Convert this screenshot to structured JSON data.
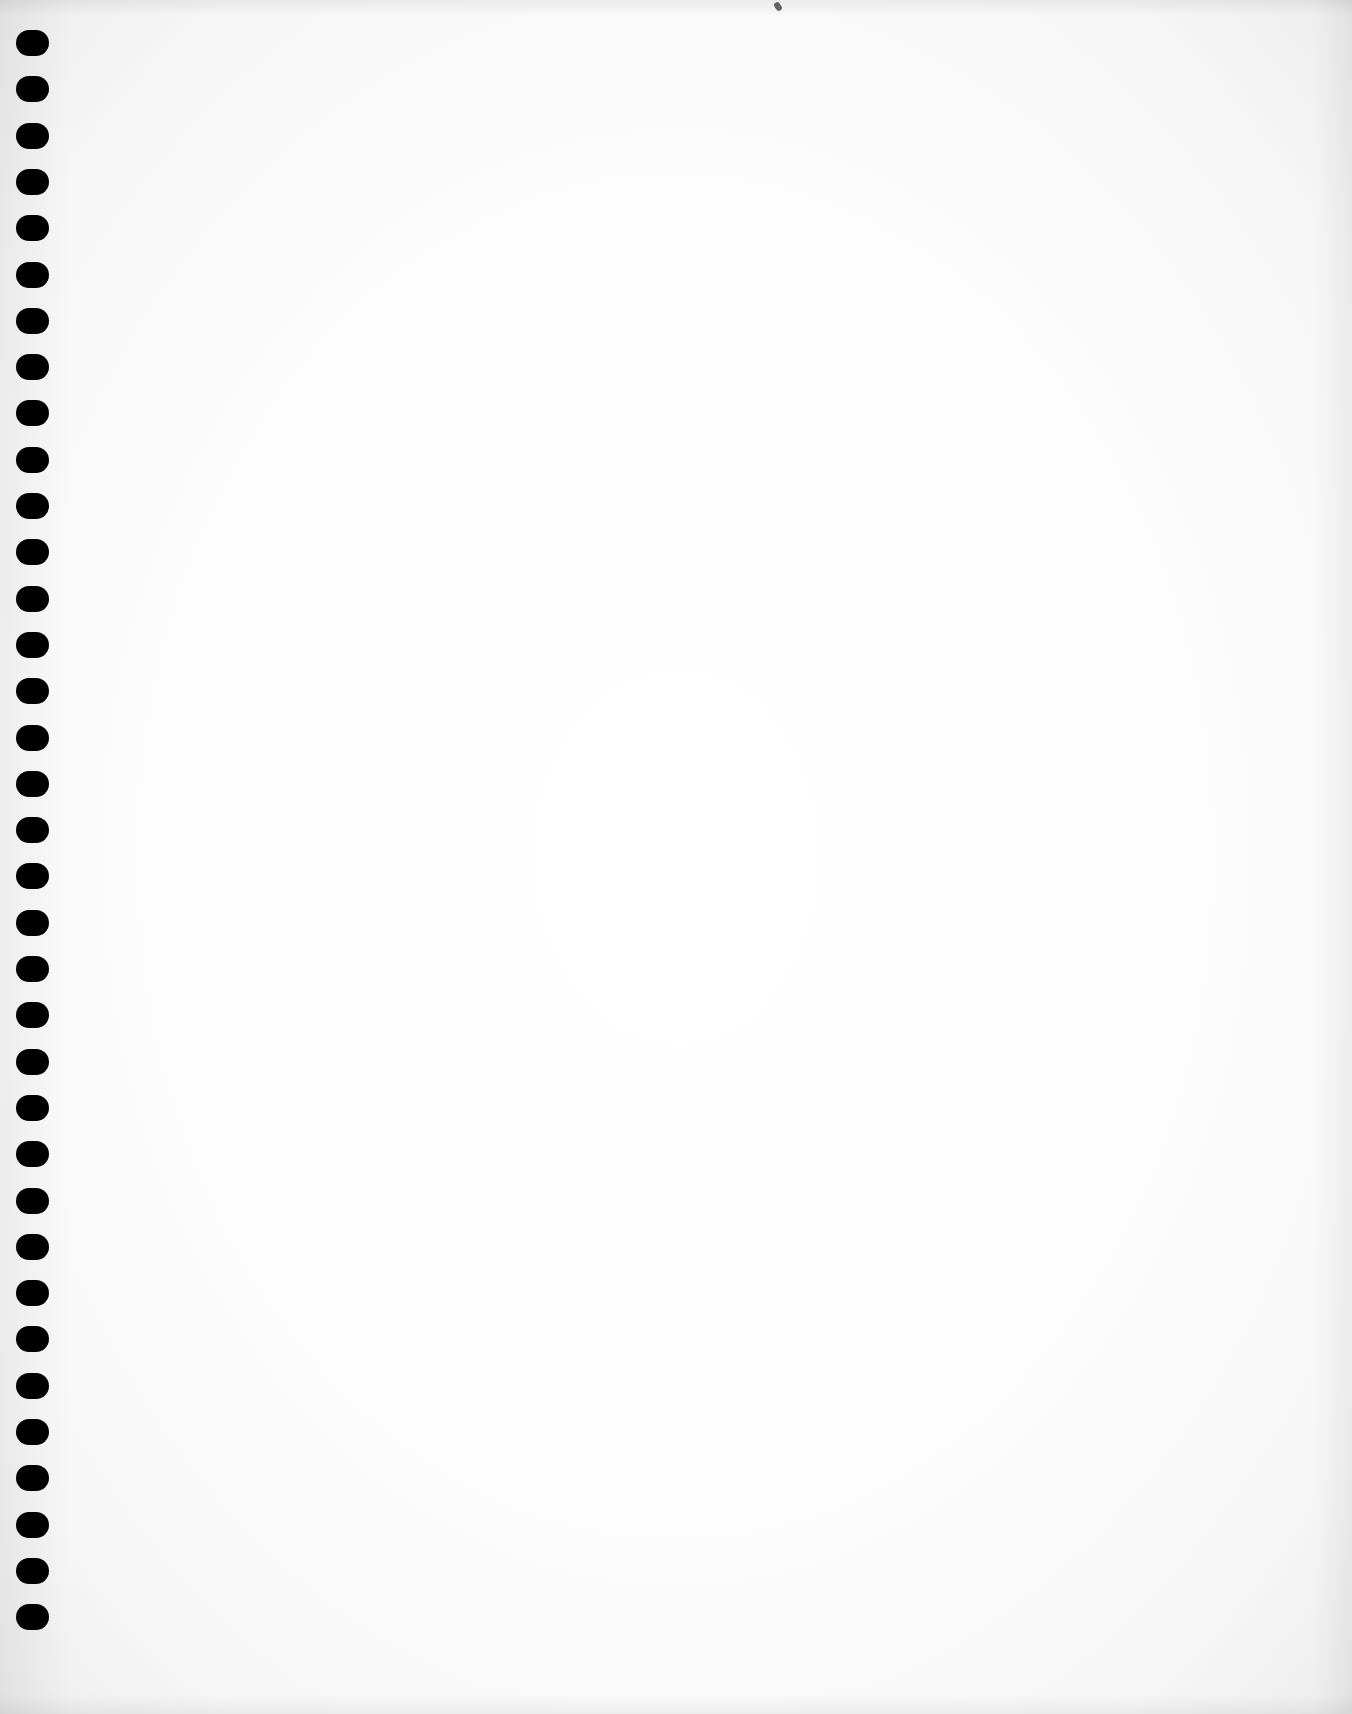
{
  "page": {
    "type": "blank notebook page",
    "background_color": "#fefefe",
    "hole_color": "#000000"
  },
  "holes": {
    "count": 35,
    "first_top": 30,
    "pitch": 46.3,
    "left": 16,
    "width": 33,
    "height": 26
  }
}
